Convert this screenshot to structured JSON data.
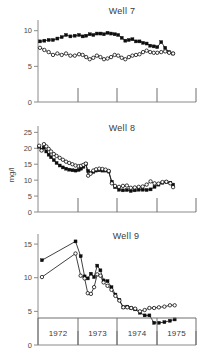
{
  "figure": {
    "y_axis_label": "mg/l",
    "year_labels": [
      "1972",
      "1973",
      "1974",
      "1975"
    ],
    "year_boundaries": [
      38,
      78,
      117,
      157,
      196
    ]
  },
  "chart_data": [
    {
      "type": "line",
      "title": "Well 7",
      "xlabel": "",
      "ylabel": "mg/l",
      "ylim": [
        0,
        11.5
      ],
      "yticks": [
        0,
        5,
        10
      ],
      "ytick_labels": [
        "0",
        "5",
        "10"
      ],
      "xlim": [
        1972.0,
        1976.0
      ],
      "grid": false,
      "legend": "none",
      "series": [
        {
          "name": "filled",
          "marker": "filled-square",
          "x": [
            1972.05,
            1972.16,
            1972.27,
            1972.38,
            1972.49,
            1972.6,
            1972.71,
            1972.82,
            1972.93,
            1973.04,
            1973.13,
            1973.22,
            1973.31,
            1973.4,
            1973.49,
            1973.58,
            1973.67,
            1973.76,
            1973.85,
            1973.94,
            1974.03,
            1974.12,
            1974.21,
            1974.3,
            1974.39,
            1974.48,
            1974.57,
            1974.66,
            1974.75,
            1974.84,
            1974.93,
            1975.02,
            1975.12,
            1975.22,
            1975.32,
            1975.42
          ],
          "y": [
            8.5,
            8.6,
            8.7,
            8.7,
            8.9,
            9.1,
            9.4,
            9.2,
            9.3,
            9.4,
            9.2,
            9.3,
            9.5,
            9.4,
            9.6,
            9.6,
            9.5,
            9.7,
            9.6,
            9.5,
            9.4,
            9.0,
            8.6,
            8.7,
            8.8,
            8.5,
            8.5,
            8.3,
            8.2,
            7.9,
            7.8,
            7.7,
            8.4,
            7.6,
            7.0,
            6.8
          ]
        },
        {
          "name": "open",
          "marker": "open-circle",
          "x": [
            1972.05,
            1972.16,
            1972.27,
            1972.38,
            1972.49,
            1972.6,
            1972.71,
            1972.82,
            1972.93,
            1973.04,
            1973.13,
            1973.22,
            1973.31,
            1973.4,
            1973.49,
            1973.58,
            1973.67,
            1973.76,
            1973.85,
            1973.94,
            1974.03,
            1974.12,
            1974.21,
            1974.3,
            1974.39,
            1974.48,
            1974.57,
            1974.66,
            1974.75,
            1974.84,
            1974.93,
            1975.02,
            1975.12,
            1975.22,
            1975.32,
            1975.42
          ],
          "y": [
            7.6,
            7.3,
            7.0,
            6.6,
            6.8,
            6.6,
            6.8,
            6.5,
            6.5,
            6.7,
            6.6,
            6.3,
            6.0,
            6.2,
            6.5,
            6.3,
            6.0,
            6.1,
            6.3,
            6.6,
            6.5,
            6.2,
            6.0,
            6.3,
            6.5,
            6.6,
            6.7,
            7.0,
            7.2,
            7.0,
            6.9,
            6.9,
            7.0,
            7.1,
            6.9,
            6.8
          ]
        }
      ]
    },
    {
      "type": "line",
      "title": "Well 8",
      "xlabel": "",
      "ylabel": "mg/l",
      "ylim": [
        0,
        27
      ],
      "yticks": [
        0,
        5,
        10,
        15,
        20,
        25
      ],
      "ytick_labels": [
        "0",
        "5",
        "10",
        "15",
        "20",
        "25"
      ],
      "xlim": [
        1972.0,
        1976.0
      ],
      "grid": false,
      "legend": "none",
      "series": [
        {
          "name": "filled",
          "marker": "filled-square",
          "x": [
            1972.03,
            1972.09,
            1972.15,
            1972.21,
            1972.27,
            1972.33,
            1972.4,
            1972.47,
            1972.55,
            1972.63,
            1972.71,
            1972.79,
            1972.87,
            1972.95,
            1973.03,
            1973.09,
            1973.15,
            1973.21,
            1973.27,
            1973.33,
            1973.4,
            1973.47,
            1973.55,
            1973.63,
            1973.71,
            1973.79,
            1973.87,
            1973.95,
            1974.05,
            1974.15,
            1974.25,
            1974.35,
            1974.45,
            1974.55,
            1974.65,
            1974.75,
            1974.85,
            1974.95,
            1975.05,
            1975.15,
            1975.25,
            1975.35,
            1975.42
          ],
          "y": [
            20.5,
            19.6,
            20.2,
            19.0,
            18.0,
            17.2,
            16.3,
            15.4,
            14.6,
            14.0,
            13.6,
            13.3,
            13.1,
            13.0,
            13.2,
            13.6,
            14.2,
            15.0,
            12.9,
            12.2,
            12.6,
            13.0,
            13.1,
            13.0,
            13.0,
            12.7,
            9.5,
            7.8,
            7.0,
            6.8,
            6.9,
            6.6,
            6.8,
            7.0,
            7.0,
            6.9,
            7.1,
            7.9,
            8.6,
            9.2,
            9.4,
            9.2,
            8.6
          ]
        },
        {
          "name": "open",
          "marker": "open-circle",
          "x": [
            1972.03,
            1972.09,
            1972.15,
            1972.21,
            1972.27,
            1972.33,
            1972.4,
            1972.47,
            1972.55,
            1972.63,
            1972.71,
            1972.79,
            1972.87,
            1972.95,
            1973.03,
            1973.09,
            1973.15,
            1973.21,
            1973.27,
            1973.33,
            1973.4,
            1973.47,
            1973.55,
            1973.63,
            1973.71,
            1973.79,
            1973.87,
            1973.95,
            1974.05,
            1974.15,
            1974.25,
            1974.35,
            1974.45,
            1974.55,
            1974.65,
            1974.75,
            1974.85,
            1974.95,
            1975.05,
            1975.15,
            1975.25,
            1975.35,
            1975.42
          ],
          "y": [
            20.8,
            19.3,
            21.3,
            20.6,
            19.8,
            19.0,
            18.2,
            17.6,
            17.0,
            16.4,
            15.8,
            15.4,
            15.0,
            14.6,
            14.4,
            14.5,
            14.8,
            15.2,
            11.4,
            12.0,
            13.0,
            13.4,
            13.6,
            13.5,
            13.3,
            12.9,
            9.0,
            8.2,
            7.9,
            8.2,
            8.3,
            7.6,
            7.7,
            7.9,
            8.0,
            8.6,
            9.6,
            9.0,
            8.9,
            9.4,
            9.5,
            9.0,
            7.8
          ]
        }
      ]
    },
    {
      "type": "line",
      "title": "Well 9",
      "xlabel": "",
      "ylabel": "mg/l",
      "ylim": [
        0,
        16.5
      ],
      "yticks": [
        0,
        5,
        10,
        15
      ],
      "ytick_labels": [
        "0",
        "5",
        "10",
        "15"
      ],
      "xlim": [
        1972.0,
        1976.0
      ],
      "grid": false,
      "legend": "none",
      "series": [
        {
          "name": "filled",
          "marker": "filled-square",
          "x": [
            1972.1,
            1972.95,
            1973.08,
            1973.18,
            1973.26,
            1973.34,
            1973.42,
            1973.5,
            1973.58,
            1973.66,
            1973.76,
            1973.86,
            1973.96,
            1974.06,
            1974.16,
            1974.26,
            1974.36,
            1974.46,
            1974.58,
            1974.7,
            1974.82,
            1974.94,
            1975.06,
            1975.2,
            1975.34,
            1975.46
          ],
          "y": [
            12.6,
            15.4,
            13.2,
            10.2,
            9.9,
            10.6,
            10.1,
            11.8,
            11.1,
            9.6,
            9.5,
            8.6,
            7.5,
            6.7,
            5.6,
            5.7,
            5.5,
            5.3,
            4.8,
            4.4,
            4.4,
            3.3,
            3.3,
            3.4,
            3.6,
            3.8
          ]
        },
        {
          "name": "open",
          "marker": "open-circle",
          "x": [
            1972.1,
            1972.95,
            1973.08,
            1973.18,
            1973.26,
            1973.34,
            1973.42,
            1973.5,
            1973.58,
            1973.66,
            1973.76,
            1973.86,
            1973.96,
            1974.06,
            1974.16,
            1974.26,
            1974.36,
            1974.46,
            1974.58,
            1974.7,
            1974.82,
            1974.94,
            1975.06,
            1975.2,
            1975.34,
            1975.46
          ],
          "y": [
            10.1,
            13.6,
            10.3,
            9.9,
            7.7,
            7.6,
            8.6,
            10.5,
            10.3,
            9.3,
            8.8,
            8.2,
            7.3,
            6.6,
            5.6,
            5.6,
            5.5,
            5.4,
            5.0,
            5.2,
            5.5,
            5.5,
            5.6,
            5.7,
            5.9,
            5.9
          ]
        }
      ]
    }
  ]
}
